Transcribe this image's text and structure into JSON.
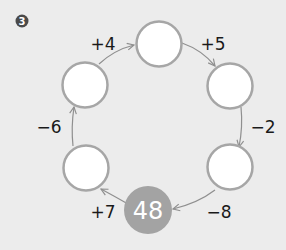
{
  "problem": {
    "marker": "3",
    "start_value": "48",
    "colors": {
      "background": "#ececec",
      "circle_stroke": "#a6a6a6",
      "circle_fill": "#ffffff",
      "start_fill": "#a3a3a3",
      "arrow": "#8f8f8f",
      "text": "#1a1a1a",
      "marker": "#4a4a4a"
    },
    "blanks": [
      {
        "id": "top",
        "value": ""
      },
      {
        "id": "upper-right",
        "value": ""
      },
      {
        "id": "lower-right",
        "value": ""
      },
      {
        "id": "lower-left",
        "value": ""
      },
      {
        "id": "upper-left",
        "value": ""
      }
    ],
    "operations": [
      {
        "from": "48",
        "to": "lower-left",
        "label": "+7"
      },
      {
        "from": "lower-left",
        "to": "upper-left",
        "label": "−6"
      },
      {
        "from": "upper-left",
        "to": "top",
        "label": "+4"
      },
      {
        "from": "top",
        "to": "upper-right",
        "label": "+5"
      },
      {
        "from": "upper-right",
        "to": "lower-right",
        "label": "−2"
      },
      {
        "from": "lower-right",
        "to": "48",
        "label": "−8"
      }
    ]
  }
}
